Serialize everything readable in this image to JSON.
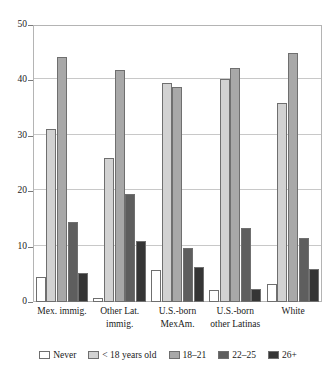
{
  "chart_data": {
    "type": "bar",
    "title": "",
    "subtitle": "",
    "xlabel": "",
    "ylabel": "",
    "ylim": [
      0,
      50
    ],
    "yticks": [
      0,
      10,
      20,
      30,
      40,
      50
    ],
    "ytick_labels": [
      "0",
      "10",
      "20",
      "30",
      "40",
      "50"
    ],
    "grid": true,
    "legend_position": "bottom",
    "categories": [
      "Mex. immig.",
      "Other Lat.\nimmig.",
      "U.S.-born\nMexAm.",
      "U.S.-born\nother Latinas",
      "White"
    ],
    "series": [
      {
        "name": "Never",
        "color": "#ffffff",
        "values": [
          4.5,
          0.7,
          5.7,
          2.2,
          3.2
        ]
      },
      {
        "name": "< 18 years old",
        "color": "#d2d2d2",
        "values": [
          31.3,
          26.0,
          39.6,
          40.3,
          36.0
        ]
      },
      {
        "name": "18–21",
        "color": "#a8a8a8",
        "values": [
          44.2,
          41.9,
          38.9,
          42.3,
          45.0
        ]
      },
      {
        "name": "22–25",
        "color": "#5e5e5e",
        "values": [
          14.4,
          19.5,
          9.7,
          13.4,
          11.5
        ]
      },
      {
        "name": "26+",
        "color": "#353535",
        "values": [
          5.2,
          11.1,
          6.3,
          2.4,
          6.0
        ]
      }
    ],
    "colors": {
      "axis": "#b4b4b4",
      "grid": "#c8c8c8",
      "bar_outline": "#6f6f6f",
      "text": "#1a1a1a",
      "background": "#ffffff"
    }
  }
}
